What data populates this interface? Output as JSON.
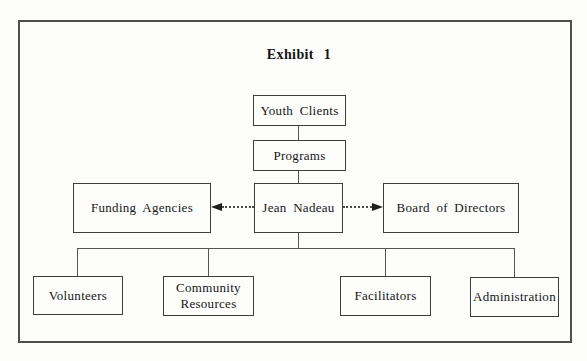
{
  "title": "Exhibit 1",
  "colors": {
    "background": "#fdfdfc",
    "frame_border": "#4e4e4e",
    "node_border": "#3e3e3e",
    "text": "#161616",
    "connector": "#555555",
    "arrow": "#1f1f1f"
  },
  "nodes": {
    "youth_clients": {
      "label": "Youth Clients"
    },
    "programs": {
      "label": "Programs"
    },
    "funding_agencies": {
      "label": "Funding Agencies"
    },
    "jean_nadeau": {
      "label": "Jean Nadeau"
    },
    "board_of_directors": {
      "label": "Board of Directors"
    },
    "volunteers": {
      "label": "Volunteers"
    },
    "community_resources": {
      "label": "Community Resources"
    },
    "facilitators": {
      "label": "Facilitators"
    },
    "administration": {
      "label": "Administration"
    }
  },
  "edges": [
    {
      "from": "youth_clients",
      "to": "programs",
      "style": "solid"
    },
    {
      "from": "programs",
      "to": "jean_nadeau",
      "style": "solid"
    },
    {
      "from": "jean_nadeau",
      "to": "funding_agencies",
      "style": "dotted-arrow"
    },
    {
      "from": "jean_nadeau",
      "to": "board_of_directors",
      "style": "dotted-arrow"
    },
    {
      "from": "jean_nadeau",
      "to": "volunteers",
      "style": "solid"
    },
    {
      "from": "jean_nadeau",
      "to": "community_resources",
      "style": "solid"
    },
    {
      "from": "jean_nadeau",
      "to": "facilitators",
      "style": "solid"
    },
    {
      "from": "jean_nadeau",
      "to": "administration",
      "style": "solid"
    }
  ]
}
